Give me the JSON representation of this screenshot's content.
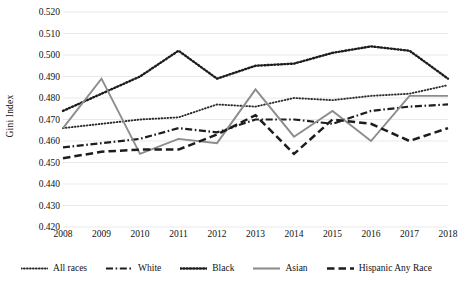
{
  "chart_data": {
    "type": "line",
    "title": "",
    "xlabel": "",
    "ylabel": "Gini Index",
    "x": [
      2008,
      2009,
      2010,
      2011,
      2012,
      2013,
      2014,
      2015,
      2016,
      2017,
      2018
    ],
    "categories": [
      "2008",
      "2009",
      "2010",
      "2011",
      "2012",
      "2013",
      "2014",
      "2015",
      "2016",
      "2017",
      "2018"
    ],
    "ylim": [
      0.42,
      0.52
    ],
    "ytick_values": [
      0.52,
      0.51,
      0.5,
      0.49,
      0.48,
      0.47,
      0.46,
      0.45,
      0.44,
      0.43,
      0.42
    ],
    "ytick_labels": [
      "0.520",
      "0.510",
      "0.500",
      "0.490",
      "0.480",
      "0.470",
      "0.460",
      "0.450",
      "0.440",
      "0.430",
      "0.420"
    ],
    "grid": true,
    "legend_position": "bottom",
    "series": [
      {
        "name": "All races",
        "style": "fine-dotted",
        "color": "#2b2b2b",
        "values": [
          0.466,
          0.468,
          0.47,
          0.471,
          0.477,
          0.476,
          0.48,
          0.479,
          0.481,
          0.482,
          0.486
        ]
      },
      {
        "name": "White",
        "style": "dash-dot",
        "color": "#1d1d1d",
        "values": [
          0.457,
          0.459,
          0.461,
          0.466,
          0.464,
          0.47,
          0.47,
          0.468,
          0.474,
          0.476,
          0.477
        ]
      },
      {
        "name": "Black",
        "style": "dotted",
        "color": "#1d1d1d",
        "values": [
          0.474,
          0.482,
          0.49,
          0.502,
          0.489,
          0.495,
          0.496,
          0.501,
          0.504,
          0.502,
          0.489
        ]
      },
      {
        "name": "Asian",
        "style": "solid",
        "color": "#8c8c8c",
        "values": [
          0.466,
          0.489,
          0.454,
          0.461,
          0.459,
          0.484,
          0.462,
          0.474,
          0.46,
          0.481,
          0.481
        ]
      },
      {
        "name": "Hispanic Any Race",
        "style": "dashed",
        "color": "#1d1d1d",
        "values": [
          0.452,
          0.455,
          0.456,
          0.456,
          0.463,
          0.472,
          0.454,
          0.47,
          0.468,
          0.46,
          0.466
        ]
      }
    ]
  }
}
